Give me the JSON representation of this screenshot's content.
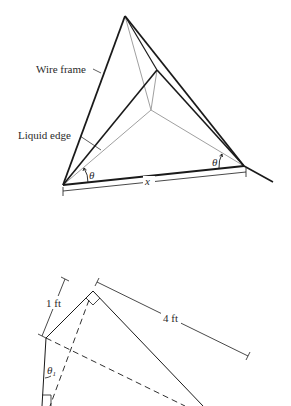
{
  "top_figure": {
    "description": "Wire frame tetrahedron with liquid film edges",
    "labels": {
      "wire_frame": "Wire frame",
      "liquid_edge": "Liquid edge",
      "theta_left": "θ",
      "theta_right": "θ",
      "x_dimension": "x"
    }
  },
  "bottom_figure": {
    "description": "Cross-section with dimensions and angle",
    "labels": {
      "one_ft": "1 ft",
      "four_ft": "4 ft",
      "theta": "θ",
      "theta_subscript": "1"
    }
  },
  "colors": {
    "line_dark": "#1a1a1a",
    "line_light": "#a0a0a0",
    "text": "#2a2a2a",
    "background": "#ffffff"
  }
}
